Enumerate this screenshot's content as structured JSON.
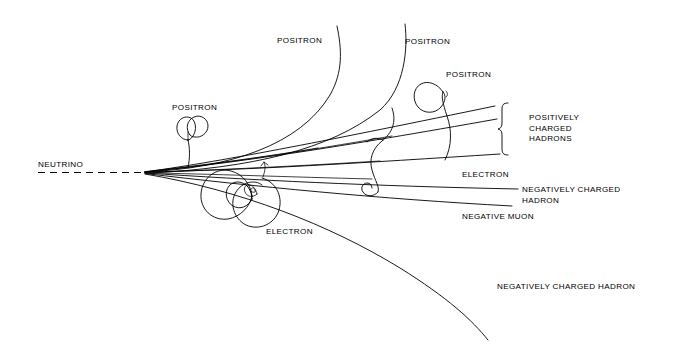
{
  "figure": {
    "kind": "bubble-chamber-event-diagram",
    "background_color": "#ffffff",
    "ink_color": "#000000",
    "width": 680,
    "height": 353
  },
  "labels": {
    "neutrino": "NEUTRINO",
    "positron_1": "POSITRON",
    "positron_2": "POSITRON",
    "positron_3": "POSITRON",
    "positron_4": "POSITRON",
    "positively_charged_hadrons": "POSITIVELY\nCHARGED\nHADRONS",
    "electron_right": "ELECTRON",
    "electron_lower": "ELECTRON",
    "negatively_charged_hadron_right": "NEGATIVELY CHARGED\nHADRON",
    "negative_muon": "NEGATIVE MUON",
    "negatively_charged_hadron_bottom": "NEGATIVELY CHARGED HADRON"
  },
  "annotations": {
    "brace_group_label": "POSITIVELY CHARGED HADRONS",
    "vertex_x": 145,
    "vertex_y": 172
  }
}
